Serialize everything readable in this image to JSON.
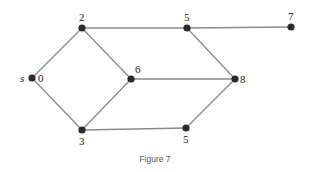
{
  "caption": "Figure 7",
  "colors": {
    "edge": "#8a8a8a",
    "node": "#2a2a2a"
  },
  "nodes": [
    {
      "id": "s",
      "value": "0",
      "prefix": "s",
      "x": 32,
      "y": 78
    },
    {
      "id": "a",
      "value": "2",
      "x": 82,
      "y": 28
    },
    {
      "id": "b",
      "value": "5",
      "x": 187,
      "y": 28
    },
    {
      "id": "c",
      "value": "7",
      "x": 291,
      "y": 27
    },
    {
      "id": "d",
      "value": "6",
      "x": 131,
      "y": 79
    },
    {
      "id": "e",
      "value": "8",
      "x": 235,
      "y": 79
    },
    {
      "id": "f",
      "value": "3",
      "x": 82,
      "y": 130
    },
    {
      "id": "g",
      "value": "5",
      "x": 186,
      "y": 128
    }
  ],
  "edges": [
    [
      "s",
      "a"
    ],
    [
      "s",
      "f"
    ],
    [
      "a",
      "b"
    ],
    [
      "b",
      "c"
    ],
    [
      "a",
      "d"
    ],
    [
      "f",
      "d"
    ],
    [
      "d",
      "e"
    ],
    [
      "b",
      "e"
    ],
    [
      "f",
      "g"
    ],
    [
      "g",
      "e"
    ]
  ]
}
